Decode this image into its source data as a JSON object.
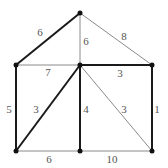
{
  "diagram": {
    "type": "weighted-undirected-graph",
    "nodes": [
      {
        "id": "top",
        "x": 80,
        "y": 13
      },
      {
        "id": "left-mid",
        "x": 16,
        "y": 65
      },
      {
        "id": "center-mid",
        "x": 80,
        "y": 65
      },
      {
        "id": "right-mid",
        "x": 152,
        "y": 65
      },
      {
        "id": "left-bot",
        "x": 16,
        "y": 151
      },
      {
        "id": "center-bot",
        "x": 80,
        "y": 151
      },
      {
        "id": "right-bot",
        "x": 152,
        "y": 151
      }
    ],
    "edges": [
      {
        "from": "top",
        "to": "left-mid",
        "weight": "6",
        "bold": true,
        "lx": 40,
        "ly": 36
      },
      {
        "from": "top",
        "to": "center-mid",
        "weight": "6",
        "bold": false,
        "lx": 86,
        "ly": 45
      },
      {
        "from": "top",
        "to": "right-mid",
        "weight": "8",
        "bold": false,
        "lx": 124,
        "ly": 40
      },
      {
        "from": "left-mid",
        "to": "center-mid",
        "weight": "7",
        "bold": false,
        "lx": 48,
        "ly": 76
      },
      {
        "from": "center-mid",
        "to": "right-mid",
        "weight": "3",
        "bold": true,
        "lx": 120,
        "ly": 77
      },
      {
        "from": "left-mid",
        "to": "left-bot",
        "weight": "5",
        "bold": true,
        "lx": 9,
        "ly": 113
      },
      {
        "from": "center-mid",
        "to": "left-bot",
        "weight": "3",
        "bold": true,
        "lx": 36,
        "ly": 113
      },
      {
        "from": "center-mid",
        "to": "center-bot",
        "weight": "4",
        "bold": true,
        "lx": 86,
        "ly": 113
      },
      {
        "from": "center-mid",
        "to": "right-bot",
        "weight": "3",
        "bold": false,
        "lx": 124,
        "ly": 113
      },
      {
        "from": "right-mid",
        "to": "right-bot",
        "weight": "1",
        "bold": true,
        "lx": 157,
        "ly": 113
      },
      {
        "from": "left-bot",
        "to": "center-bot",
        "weight": "6",
        "bold": false,
        "lx": 49,
        "ly": 163
      },
      {
        "from": "center-bot",
        "to": "right-bot",
        "weight": "10",
        "bold": false,
        "lx": 112,
        "ly": 163
      }
    ]
  }
}
